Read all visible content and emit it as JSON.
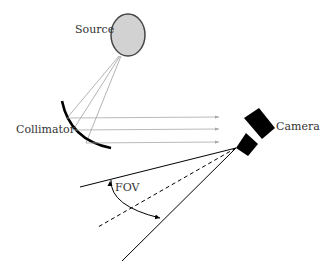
{
  "diagram": {
    "labels": {
      "source": "Source",
      "collimator": "Collimator",
      "camera": "Camera",
      "fov": "FOV"
    },
    "colors": {
      "source_fill": "#cfcfcf",
      "source_stroke": "#444444",
      "ray": "#a0a0a0",
      "ink": "#000000"
    }
  }
}
